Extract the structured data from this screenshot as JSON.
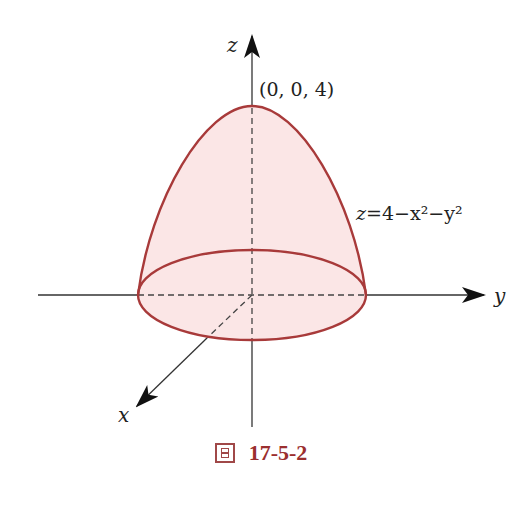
{
  "figure": {
    "caption_prefix": "圖",
    "caption_number": "17-5-2",
    "axes": {
      "x_label": "x",
      "y_label": "y",
      "z_label": "z"
    },
    "annotations": {
      "apex_point": "(0, 0, 4)",
      "surface_equation_lhs": "z",
      "surface_equation_rhs": "=4−x²−y²"
    },
    "surface": {
      "name": "paraboloid",
      "equation": "z = 4 − x² − y²",
      "apex": [
        0,
        0,
        4
      ],
      "base_radius": 2
    },
    "colors": {
      "outline": "#a83a3a",
      "fill": "#fbe6e6",
      "axis": "#333333",
      "caption": "#9b2f2f"
    }
  }
}
